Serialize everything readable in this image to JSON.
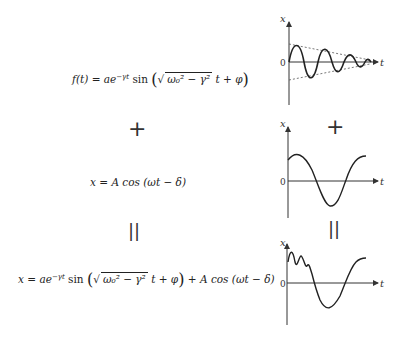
{
  "equations": {
    "damped": {
      "lhs": "f(t) = ae",
      "exp": "−γt",
      "fn": " sin ",
      "sqrt_inner": "ω₀² − γ²",
      "rest": " t + φ"
    },
    "forced": {
      "text": "x = A cos (ωt − δ)"
    },
    "sum": {
      "lhs": "x = ae",
      "exp": "−γt",
      "fn": " sin ",
      "sqrt_inner": "ω₀² − γ²",
      "rest": " t + φ",
      "tail": " + A cos (ωt − δ)"
    }
  },
  "operators": {
    "plus_left": "+",
    "plus_right": "+",
    "equals_left": "||",
    "equals_right": "||"
  },
  "graphs": [
    {
      "id": "damped-oscillation",
      "y_label": "x",
      "x_label": "t",
      "origin_label": "0"
    },
    {
      "id": "forced-oscillation",
      "y_label": "x",
      "x_label": "t",
      "origin_label": "0"
    },
    {
      "id": "superposition",
      "y_label": "x",
      "x_label": "t",
      "origin_label": "0"
    }
  ]
}
